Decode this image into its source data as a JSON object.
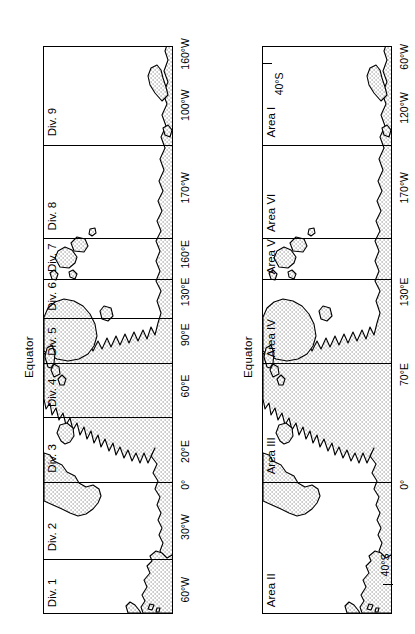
{
  "figure": {
    "orientation": "rotated-90-ccw",
    "panel_count": 2
  },
  "maps": [
    {
      "id": "divisions-map",
      "top_axis_label": "Equator",
      "sector_scheme": "Div.",
      "sectors": [
        {
          "label": "Div. 1",
          "x_pct": 0.5
        },
        {
          "label": "Div. 2",
          "x_pct": 10.5
        },
        {
          "label": "Div. 3",
          "x_pct": 24.5
        },
        {
          "label": "Div. 4",
          "x_pct": 36.0
        },
        {
          "label": "Div. 5",
          "x_pct": 45.5
        },
        {
          "label": "Div. 6",
          "x_pct": 53.5
        },
        {
          "label": "Div. 7",
          "x_pct": 60.0
        },
        {
          "label": "Div. 8",
          "x_pct": 67.5
        },
        {
          "label": "Div. 9",
          "x_pct": 85.0
        }
      ],
      "dividers_pct": [
        9.3,
        23.0,
        34.5,
        44.0,
        52.0,
        58.8,
        66.0,
        82.5
      ],
      "lon_labels": [
        {
          "text": "60°W",
          "x_pct": 2.0
        },
        {
          "text": "30°W",
          "x_pct": 13.0
        },
        {
          "text": "0°",
          "x_pct": 21.5
        },
        {
          "text": "20°E",
          "x_pct": 27.0
        },
        {
          "text": "60°E",
          "x_pct": 38.5
        },
        {
          "text": "90°E",
          "x_pct": 47.5
        },
        {
          "text": "130°E",
          "x_pct": 55.0
        },
        {
          "text": "160°E",
          "x_pct": 62.0
        },
        {
          "text": "170°W",
          "x_pct": 73.0
        },
        {
          "text": "100°W",
          "x_pct": 87.5
        },
        {
          "text": "160°W",
          "x_pct": 96.5
        }
      ],
      "lat_ticks": []
    },
    {
      "id": "areas-map",
      "top_axis_label": "Equator",
      "sector_scheme": "Area",
      "sectors": [
        {
          "label": "Area II",
          "x_pct": 0.5
        },
        {
          "label": "Area III",
          "x_pct": 24.5
        },
        {
          "label": "Area IV",
          "x_pct": 45.5
        },
        {
          "label": "Area V",
          "x_pct": 60.0
        },
        {
          "label": "Area VI",
          "x_pct": 67.5
        },
        {
          "label": "Area I",
          "x_pct": 85.0
        }
      ],
      "dividers_pct": [
        23.0,
        44.0,
        58.8,
        66.0,
        82.5
      ],
      "lon_labels": [
        {
          "text": "0°",
          "x_pct": 21.5
        },
        {
          "text": "70°E",
          "x_pct": 40.5
        },
        {
          "text": "130°E",
          "x_pct": 55.0
        },
        {
          "text": "170°W",
          "x_pct": 73.0
        },
        {
          "text": "120°W",
          "x_pct": 87.5
        },
        {
          "text": "60°W",
          "x_pct": 96.5
        }
      ],
      "lat_ticks": [
        {
          "text": "40°S",
          "x_pct": 5.0,
          "side": "bottom"
        },
        {
          "text": "40°S",
          "x_pct": 96.5,
          "side": "top"
        }
      ]
    }
  ],
  "colors": {
    "ink": "#000000",
    "paper": "#ffffff",
    "land_fill": "#e8e8e8",
    "stipple_dot": "#555555"
  }
}
